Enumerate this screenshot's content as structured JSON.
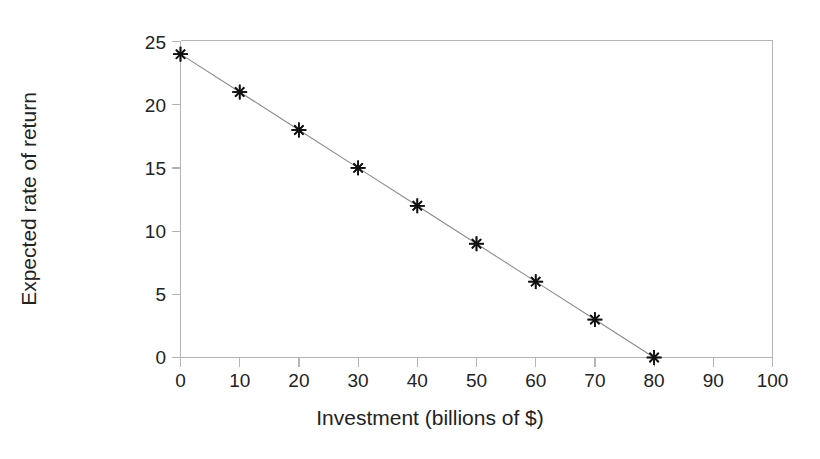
{
  "chart_data": {
    "type": "line",
    "title": "",
    "subtitle": "",
    "xlabel": "Investment (billions of $)",
    "ylabel": "Expected rate of return",
    "x": [
      0,
      10,
      20,
      30,
      40,
      50,
      60,
      70,
      80
    ],
    "values": [
      24,
      21,
      18,
      15,
      12,
      9,
      6,
      3,
      0
    ],
    "series": [
      {
        "name": "Investment demand",
        "x": [
          0,
          10,
          20,
          30,
          40,
          50,
          60,
          70,
          80
        ],
        "values": [
          24,
          21,
          18,
          15,
          12,
          9,
          6,
          3,
          0
        ]
      }
    ],
    "xlim": [
      0,
      100
    ],
    "ylim": [
      0,
      25
    ],
    "xticks": [
      0,
      10,
      20,
      30,
      40,
      50,
      60,
      70,
      80,
      90,
      100
    ],
    "yticks": [
      0,
      5,
      10,
      15,
      20,
      25
    ],
    "xtick_labels": [
      "0",
      "10",
      "20",
      "30",
      "40",
      "50",
      "60",
      "70",
      "80",
      "90",
      "100"
    ],
    "ytick_labels": [
      "0",
      "5",
      "10",
      "15",
      "20",
      "25"
    ],
    "grid": false,
    "legend": null,
    "legend_position": "none",
    "marker": "asterisk",
    "line_color": "#8a8a8a",
    "marker_color": "#111111",
    "axis_color": "#b4b4b4",
    "text_color": "#232323",
    "background_color": "#ffffff",
    "annotations": []
  }
}
